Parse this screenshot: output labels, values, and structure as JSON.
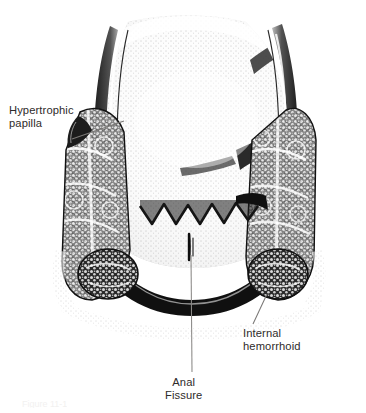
{
  "figure": {
    "background_color": "#ffffff",
    "ink_color": "#1a1a1a",
    "label_color": "#2e2b2a",
    "leader_color": "#7a7876",
    "width": 366,
    "height": 413
  },
  "labels": {
    "hypertrophic_papilla": "Hypertrophic\npapilla",
    "internal_hemorrhoid": "Internal\nhemorrhoid",
    "anal_fissure": "Anal\nFissure"
  },
  "caption": {
    "clipped_text": "Figure 11-1"
  },
  "structures": [
    {
      "name": "rectal-lumen",
      "description": "Stippled upper rectal lumen and mucosal surface"
    },
    {
      "name": "dentate-line",
      "description": "Scalloped zigzag dentate line across mid canal"
    },
    {
      "name": "anal-fissure",
      "description": "Vertical linear tear below the dentate line at midline"
    },
    {
      "name": "left-hemorrhoidal-column",
      "description": "Lobulated stippled vascular cushion, left side"
    },
    {
      "name": "right-hemorrhoidal-column",
      "description": "Lobulated stippled vascular cushion, right side"
    },
    {
      "name": "hypertrophic-papilla",
      "description": "Enlarged anal papilla at upper left margin"
    },
    {
      "name": "internal-hemorrhoid-mass",
      "description": "Bulbous prolapsing internal hemorrhoid, right inferior"
    },
    {
      "name": "anal-verge",
      "description": "Dark inferior arc forming the anal verge"
    }
  ],
  "leaders": [
    {
      "name": "leader-hypertrophic-papilla",
      "from": [
        72,
        139
      ],
      "to": [
        122,
        122
      ]
    },
    {
      "name": "leader-anal-fissure",
      "from": [
        191,
        255
      ],
      "to": [
        192,
        372
      ]
    },
    {
      "name": "leader-internal-hemorrhoid",
      "from": [
        266,
        296
      ],
      "to": [
        254,
        324
      ]
    }
  ]
}
